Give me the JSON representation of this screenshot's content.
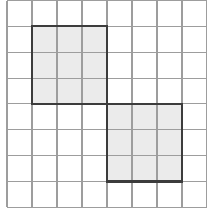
{
  "figure": {
    "kind": "grid-diagram",
    "background_color": "#ffffff",
    "grid": {
      "columns": 8,
      "rows": 8,
      "cell_width": 25.0,
      "cell_height": 25.85,
      "origin_x": 7.0,
      "origin_y": 0.5,
      "line_color": "#9d9d9d",
      "line_width": 1.1,
      "label": "8 by 8 square grid"
    },
    "shapes": [
      {
        "name": "shaded-square-top-left",
        "description": "3 by 3 shaded square in upper left region",
        "col_start": 1,
        "row_start": 1,
        "cols_spanned": 3,
        "rows_spanned": 3,
        "fill_color": "#ebebeb",
        "stroke_color": "#3c3c3c",
        "stroke_width": 2.1,
        "area_in_cells": 9
      },
      {
        "name": "shaded-square-bottom-right",
        "description": "3 by 3 shaded square in lower right region, touching the first square at one corner",
        "col_start": 4,
        "row_start": 4,
        "cols_spanned": 3,
        "rows_spanned": 3,
        "fill_color": "#ebebeb",
        "stroke_color": "#3c3c3c",
        "stroke_width": 2.1,
        "area_in_cells": 9
      }
    ],
    "touch_point": {
      "name": "shared-corner",
      "col": 4,
      "row": 4,
      "description": "the two squares meet corner to corner"
    },
    "labels": [],
    "annotations": []
  }
}
